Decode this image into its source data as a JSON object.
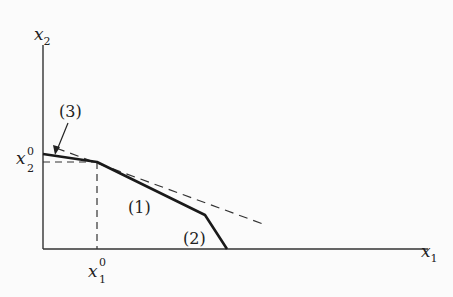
{
  "diagram": {
    "axes": {
      "x_label": "x",
      "x_sub": "1",
      "y_label": "x",
      "y_sub": "2"
    },
    "points": {
      "x1_zero_label": "x",
      "x1_zero_sub": "1",
      "x1_zero_sup": "0",
      "x2_zero_label": "x",
      "x2_zero_sub": "2",
      "x2_zero_sup": "0"
    },
    "segment_labels": {
      "seg1": "(1)",
      "seg2": "(2)",
      "seg3": "(3)"
    },
    "colors": {
      "ink": "#222222",
      "background": "#fbfbfb"
    }
  }
}
